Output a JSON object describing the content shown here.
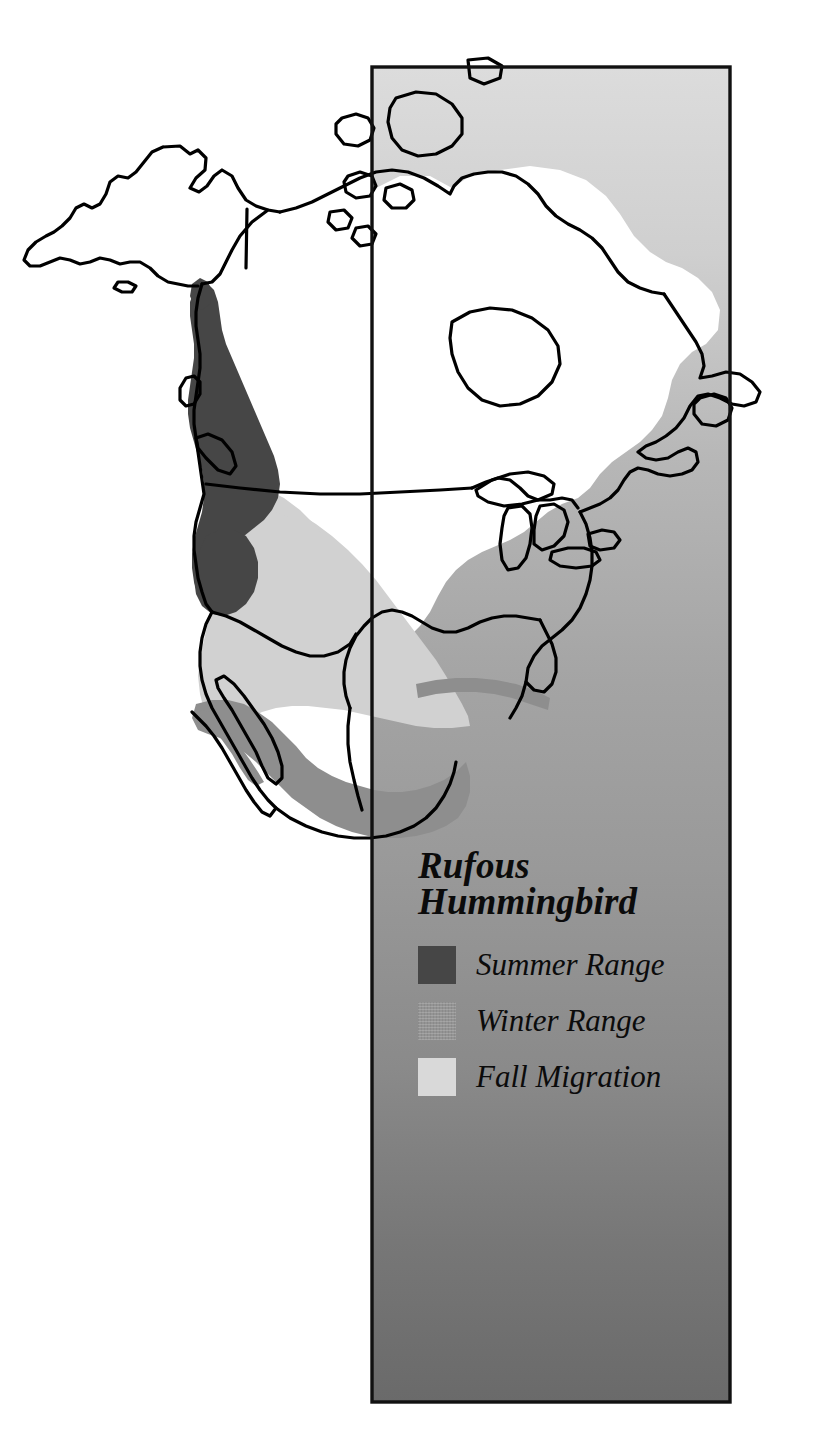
{
  "figure": {
    "type": "range-map",
    "region": "North America",
    "title_lines": "Rufous\nHummingbird",
    "title_text": "Rufous Hummingbird"
  },
  "colors": {
    "summer_range": "#464646",
    "winter_range": "#949494",
    "fall_migration": "#d9d9d9",
    "panel_top": "#d8d8d8",
    "panel_bottom": "#6b6b6b",
    "panel_border": "#000000",
    "coastline": "#000000",
    "land_fill": "#ffffff",
    "page_background": "#ffffff"
  },
  "panel": {
    "x": 372,
    "y": 67,
    "width": 358,
    "height": 1335
  },
  "legend": {
    "title": "Rufous\nHummingbird",
    "items": [
      {
        "label": "Summer Range",
        "swatch": "summer",
        "color": "#464646"
      },
      {
        "label": "Winter Range",
        "swatch": "winter",
        "color": "#949494"
      },
      {
        "label": "Fall Migration",
        "swatch": "fall",
        "color": "#d9d9d9"
      }
    ]
  },
  "map_features": {
    "landmasses": [
      "Alaska",
      "Canada",
      "Greenland-edge",
      "United States",
      "Mexico",
      "Baja California",
      "Newfoundland",
      "Great Lakes",
      "Hudson Bay",
      "Aleutian Islands",
      "Vancouver Island",
      "Florida"
    ],
    "range_bands": [
      {
        "name": "Summer Range",
        "description": "Pacific Northwest coastal strip from southeast Alaska panhandle through British Columbia to northern California"
      },
      {
        "name": "Fall Migration",
        "description": "Broad wedge across the western United States from the Pacific Northwest southeast toward Texas and the Gulf"
      },
      {
        "name": "Winter Range",
        "description": "Coastal and interior Mexico plus the Gulf Coast band"
      }
    ]
  }
}
